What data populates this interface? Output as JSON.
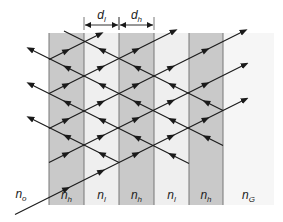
{
  "figure": {
    "type": "multilayer-interference-diagram",
    "colors": {
      "high_index_layer": "#c9c9c9",
      "low_index_layer": "#efefef",
      "substrate": "#f6f6f6",
      "boundary": "#777777",
      "ray": "#1a1a1a"
    },
    "layers": [
      {
        "id": "h1",
        "label": "n",
        "sub": "h",
        "x0": 49,
        "x1": 84,
        "kind": "high"
      },
      {
        "id": "l1",
        "label": "n",
        "sub": "l",
        "x0": 84,
        "x1": 119,
        "kind": "low"
      },
      {
        "id": "h2",
        "label": "n",
        "sub": "h",
        "x0": 119,
        "x1": 154,
        "kind": "high"
      },
      {
        "id": "l2",
        "label": "n",
        "sub": "l",
        "x0": 154,
        "x1": 189,
        "kind": "low"
      },
      {
        "id": "h3",
        "label": "n",
        "sub": "h",
        "x0": 189,
        "x1": 223,
        "kind": "high"
      },
      {
        "id": "G",
        "label": "n",
        "sub": "G",
        "x0": 223,
        "x1": 274,
        "kind": "substrate"
      }
    ],
    "medium_label": {
      "label": "n",
      "sub": "o"
    },
    "dimension_labels": [
      {
        "label": "d",
        "sub": "l",
        "x0": 84,
        "x1": 119
      },
      {
        "label": "d",
        "sub": "h",
        "x0": 119,
        "x1": 154
      }
    ],
    "layer_top": 33,
    "layer_bottom": 205,
    "ray_slope": 0.5,
    "up_rays": [
      {
        "c": 222,
        "x0": 15,
        "x1": 245,
        "arrow_end": true
      },
      {
        "c": 187,
        "x0": 49,
        "x1": 245,
        "arrow_end": true
      },
      {
        "c": 153,
        "x0": 49,
        "x1": 245,
        "arrow_end": true
      },
      {
        "c": 118,
        "x0": 49,
        "x1": 245,
        "arrow_end": false
      },
      {
        "c": 84,
        "x0": 49,
        "x1": 100,
        "arrow_end": false
      }
    ],
    "down_rays": [
      {
        "c": -1,
        "x0": 30,
        "x1": 223
      },
      {
        "c": 34,
        "x0": 30,
        "x1": 223
      },
      {
        "c": 69,
        "x0": 30,
        "x1": 189
      },
      {
        "c": 103,
        "x0": 30,
        "x1": 119
      }
    ]
  }
}
